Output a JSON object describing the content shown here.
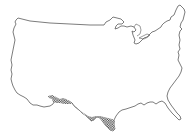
{
  "map": {
    "subject": "Contiguous United States outline",
    "type": "range-map",
    "outline_color": "#5a5a5a",
    "fill_color": "#ffffff",
    "range_pattern": "cross-hatched",
    "range_color": "#3a3a3a",
    "range_region": "Southern border: southeastern Arizona, southern New Mexico, and south Texas"
  }
}
